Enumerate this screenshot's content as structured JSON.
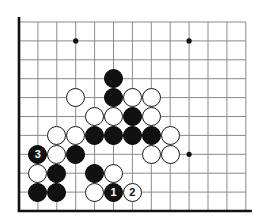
{
  "board": {
    "title": "Go board diagram",
    "geometry": {
      "origin_x": 19,
      "origin_y": 22,
      "spacing": 18.9,
      "cols": 13,
      "rows": 11,
      "stone_radius": 9.6,
      "edge_left_x": 19,
      "edge_bottom_y": 211
    },
    "colors": {
      "background": "#ffffff",
      "grid_line": "#8a8a8a",
      "edge_line": "#111111",
      "black_stone": "#111111",
      "white_stone": "#ffffff",
      "white_stone_border": "#1a1a1a",
      "black_label_text": "#ffffff",
      "white_label_text": "#111111",
      "star_point": "#111111"
    },
    "edges": {
      "left": true,
      "bottom": true,
      "top": false,
      "right": false
    },
    "star_points": [
      {
        "col": 3,
        "row": 1
      },
      {
        "col": 9,
        "row": 1
      },
      {
        "col": 9,
        "row": 7
      }
    ],
    "stones": [
      {
        "col": 5,
        "row": 3,
        "color": "black",
        "label": ""
      },
      {
        "col": 5,
        "row": 4,
        "color": "black",
        "label": ""
      },
      {
        "col": 3,
        "row": 4,
        "color": "white",
        "label": ""
      },
      {
        "col": 6,
        "row": 4,
        "color": "white",
        "label": ""
      },
      {
        "col": 7,
        "row": 4,
        "color": "white",
        "label": ""
      },
      {
        "col": 4,
        "row": 5,
        "color": "white",
        "label": ""
      },
      {
        "col": 5,
        "row": 5,
        "color": "white",
        "label": ""
      },
      {
        "col": 6,
        "row": 5,
        "color": "black",
        "label": ""
      },
      {
        "col": 7,
        "row": 5,
        "color": "white",
        "label": ""
      },
      {
        "col": 2,
        "row": 6,
        "color": "white",
        "label": ""
      },
      {
        "col": 3,
        "row": 6,
        "color": "white",
        "label": ""
      },
      {
        "col": 4,
        "row": 6,
        "color": "black",
        "label": ""
      },
      {
        "col": 5,
        "row": 6,
        "color": "black",
        "label": ""
      },
      {
        "col": 6,
        "row": 6,
        "color": "black",
        "label": ""
      },
      {
        "col": 7,
        "row": 6,
        "color": "black",
        "label": ""
      },
      {
        "col": 8,
        "row": 6,
        "color": "white",
        "label": ""
      },
      {
        "col": 7,
        "row": 7,
        "color": "white",
        "label": ""
      },
      {
        "col": 8,
        "row": 7,
        "color": "white",
        "label": ""
      },
      {
        "col": 1,
        "row": 7,
        "color": "black",
        "label": "3"
      },
      {
        "col": 2,
        "row": 7,
        "color": "white",
        "label": ""
      },
      {
        "col": 3,
        "row": 7,
        "color": "black",
        "label": ""
      },
      {
        "col": 1,
        "row": 8,
        "color": "white",
        "label": ""
      },
      {
        "col": 2,
        "row": 8,
        "color": "black",
        "label": ""
      },
      {
        "col": 4,
        "row": 8,
        "color": "black",
        "label": ""
      },
      {
        "col": 5,
        "row": 8,
        "color": "white",
        "label": ""
      },
      {
        "col": 1,
        "row": 9,
        "color": "black",
        "label": ""
      },
      {
        "col": 2,
        "row": 9,
        "color": "black",
        "label": ""
      },
      {
        "col": 4,
        "row": 9,
        "color": "white",
        "label": ""
      },
      {
        "col": 5,
        "row": 9,
        "color": "black",
        "label": "1"
      },
      {
        "col": 6,
        "row": 9,
        "color": "white",
        "label": "2"
      }
    ],
    "move_labels": [
      {
        "number": "1",
        "color": "black",
        "col": 5,
        "row": 9
      },
      {
        "number": "2",
        "color": "white",
        "col": 6,
        "row": 9
      },
      {
        "number": "3",
        "color": "black",
        "col": 1,
        "row": 7
      }
    ]
  }
}
